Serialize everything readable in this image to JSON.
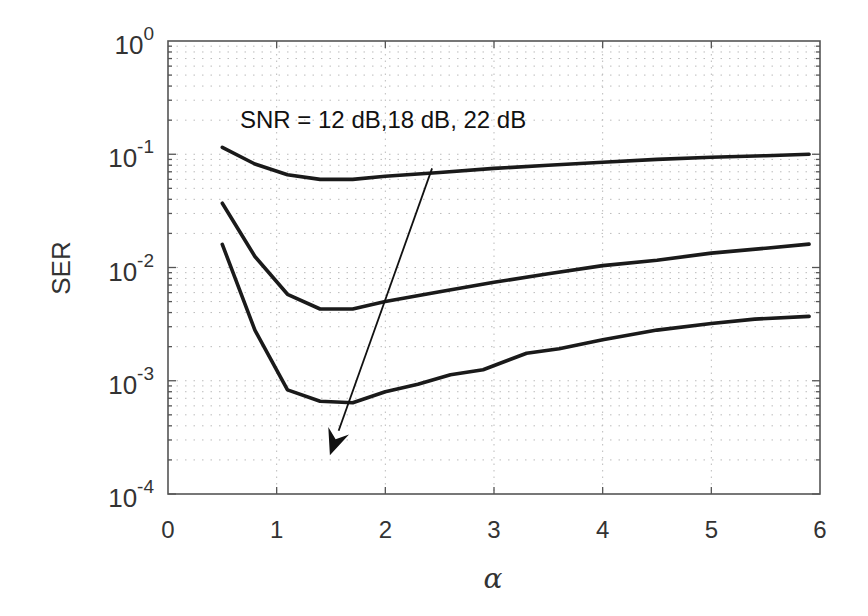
{
  "chart_data": {
    "type": "line",
    "title": "",
    "xlabel": "α",
    "ylabel": "SER",
    "xscale": "linear",
    "yscale": "log",
    "xlim": [
      0,
      6
    ],
    "ylim": [
      0.0001,
      1
    ],
    "xticks": [
      0,
      1,
      2,
      3,
      4,
      5,
      6
    ],
    "yticks": [
      {
        "value": 1,
        "base": "10",
        "exp": "0"
      },
      {
        "value": 0.1,
        "base": "10",
        "exp": "-1"
      },
      {
        "value": 0.01,
        "base": "10",
        "exp": "-2"
      },
      {
        "value": 0.001,
        "base": "10",
        "exp": "-3"
      },
      {
        "value": 0.0001,
        "base": "10",
        "exp": "-4"
      }
    ],
    "grid": {
      "major": true,
      "minor": true,
      "style": "dotted"
    },
    "legend": null,
    "annotation": {
      "text": "SNR = 12 dB,18 dB, 22 dB",
      "arrow_from": [
        2.43,
        0.075
      ],
      "arrow_to": [
        1.49,
        0.00022
      ]
    },
    "series": [
      {
        "name": "SNR = 12 dB",
        "x": [
          0.5,
          0.8,
          1.1,
          1.4,
          1.7,
          2.0,
          2.5,
          3.0,
          3.5,
          4.0,
          4.5,
          5.0,
          5.5,
          5.9
        ],
        "values": [
          0.115,
          0.082,
          0.066,
          0.06,
          0.06,
          0.064,
          0.069,
          0.075,
          0.08,
          0.085,
          0.09,
          0.094,
          0.097,
          0.1
        ]
      },
      {
        "name": "SNR = 18 dB",
        "x": [
          0.5,
          0.8,
          1.1,
          1.4,
          1.7,
          2.0,
          2.5,
          3.0,
          3.5,
          4.0,
          4.5,
          5.0,
          5.5,
          5.9
        ],
        "values": [
          0.037,
          0.0125,
          0.0058,
          0.0043,
          0.0043,
          0.005,
          0.0061,
          0.0074,
          0.0088,
          0.0104,
          0.0116,
          0.0134,
          0.0148,
          0.0161
        ]
      },
      {
        "name": "SNR = 22 dB",
        "x": [
          0.5,
          0.8,
          1.1,
          1.4,
          1.7,
          2.0,
          2.3,
          2.6,
          2.9,
          3.3,
          3.6,
          4.0,
          4.5,
          5.0,
          5.4,
          5.9
        ],
        "values": [
          0.016,
          0.0028,
          0.00083,
          0.00066,
          0.00064,
          0.0008,
          0.00093,
          0.00113,
          0.00125,
          0.00175,
          0.00192,
          0.0023,
          0.0028,
          0.0032,
          0.0035,
          0.0037
        ]
      }
    ]
  },
  "layout": {
    "plot_left": 168,
    "plot_top": 41,
    "plot_right": 820,
    "plot_bottom": 494,
    "line_color": "#1a1a1a",
    "axis_color": "#555555",
    "grid_color": "#bbbbbb"
  }
}
